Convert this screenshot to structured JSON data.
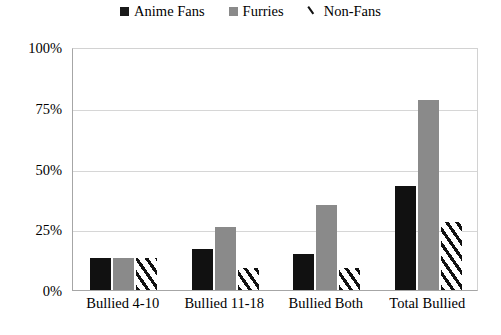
{
  "chart_data": {
    "type": "bar",
    "title": "",
    "xlabel": "",
    "ylabel": "",
    "categories": [
      "Bullied 4-10",
      "Bullied 11-18",
      "Bullied Both",
      "Total Bullied"
    ],
    "series": [
      {
        "name": "Anime Fans",
        "values": [
          13,
          17,
          15,
          43
        ],
        "color": "#111111",
        "fill": "solid-black"
      },
      {
        "name": "Furries",
        "values": [
          13,
          26,
          35,
          78
        ],
        "color": "#8a8a8a",
        "fill": "solid-gray"
      },
      {
        "name": "Non-Fans",
        "values": [
          13,
          9,
          9,
          28
        ],
        "color": "#111111",
        "fill": "diagonal-hatch"
      }
    ],
    "ylim": [
      0,
      100
    ],
    "yticks": [
      0,
      25,
      50,
      75,
      100
    ],
    "ytick_labels": [
      "0%",
      "25%",
      "50%",
      "75%",
      "100%"
    ],
    "grid": true,
    "grid_axis": "y",
    "legend_position": "top-center",
    "value_suffix": "%"
  },
  "legend": {
    "items": [
      {
        "label": "Anime Fans",
        "marker": "filled-square-black"
      },
      {
        "label": "Furries",
        "marker": "filled-square-gray"
      },
      {
        "label": "Non-Fans",
        "marker": "diagonal-stroke"
      }
    ]
  }
}
